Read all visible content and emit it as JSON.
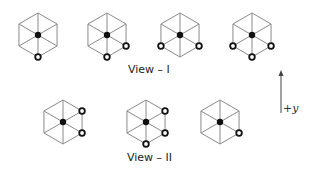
{
  "views": [
    {
      "label": "View – I",
      "label_pos": [
        128,
        70
      ],
      "hexagons": [
        {
          "cx": 38,
          "cy": 35,
          "marked": [
            "b"
          ]
        },
        {
          "cx": 107,
          "cy": 35,
          "marked": [
            "b",
            "lr"
          ]
        },
        {
          "cx": 180,
          "cy": 35,
          "marked": [
            "ll",
            "lr"
          ]
        },
        {
          "cx": 252,
          "cy": 35,
          "marked": [
            "ll",
            "b",
            "lr"
          ]
        }
      ]
    },
    {
      "label": "View – II",
      "label_pos": [
        127,
        158
      ],
      "hexagons": [
        {
          "cx": 63,
          "cy": 122,
          "marked": [
            "ur",
            "lr"
          ]
        },
        {
          "cx": 146,
          "cy": 122,
          "marked": [
            "ur",
            "lr",
            "b"
          ]
        },
        {
          "cx": 220,
          "cy": 122,
          "marked": [
            "lr"
          ]
        }
      ]
    }
  ],
  "axis": {
    "label": "+y",
    "x": 281,
    "y_top": 70,
    "y_bottom": 113
  },
  "colors": {
    "line": "#8a8a8a",
    "node": "#111111",
    "marked_stroke": "#111111",
    "marked_fill": "#ffffff"
  },
  "hex_radius": 22
}
